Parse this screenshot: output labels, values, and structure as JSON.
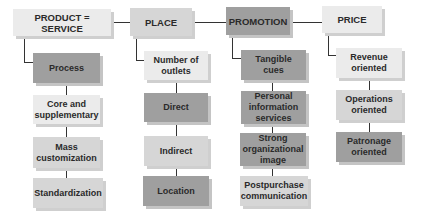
{
  "diagram": {
    "columns": [
      {
        "header": "PRODUCT = SERVICE",
        "header_shade": "light",
        "items": [
          {
            "label": "Process",
            "shade": "dark"
          },
          {
            "label": "Core and\nsupplementary",
            "shade": "light"
          },
          {
            "label": "Mass\ncustomization",
            "shade": "mid"
          },
          {
            "label": "Standardization",
            "shade": "mid"
          }
        ]
      },
      {
        "header": "PLACE",
        "header_shade": "mid",
        "items": [
          {
            "label": "Number of\noutlets",
            "shade": "light"
          },
          {
            "label": "Direct",
            "shade": "dark"
          },
          {
            "label": "Indirect",
            "shade": "mid"
          },
          {
            "label": "Location",
            "shade": "dark"
          }
        ]
      },
      {
        "header": "PROMOTION",
        "header_shade": "dark",
        "items": [
          {
            "label": "Tangible\ncues",
            "shade": "dark"
          },
          {
            "label": "Personal\ninformation\nservices",
            "shade": "dark"
          },
          {
            "label": "Strong\norganizational\nimage",
            "shade": "dark"
          },
          {
            "label": "Postpurchase\ncommunication",
            "shade": "mid"
          }
        ]
      },
      {
        "header": "PRICE",
        "header_shade": "light",
        "items": [
          {
            "label": "Revenue\noriented",
            "shade": "light"
          },
          {
            "label": "Operations\noriented",
            "shade": "mid"
          },
          {
            "label": "Patronage\noriented",
            "shade": "dark"
          }
        ]
      }
    ]
  },
  "colors": {
    "light": "#ebebeb",
    "mid": "#d6d6d6",
    "dark": "#9f9f9f",
    "connector": "#333333",
    "text": "#2a2a2a"
  }
}
